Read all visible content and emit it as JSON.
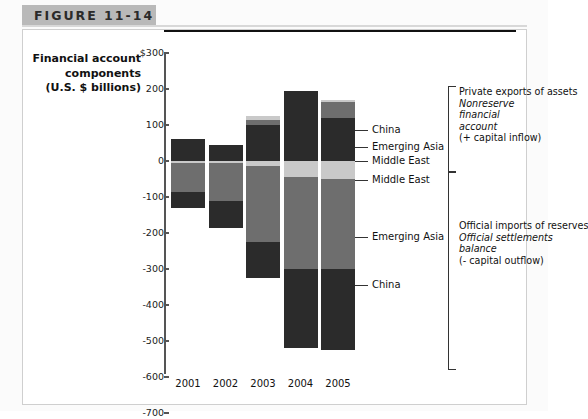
{
  "figure": {
    "label": "FIGURE 11-14"
  },
  "chart_data": {
    "type": "bar",
    "subtype": "stacked-diverging",
    "title": "Financial account components (U.S. $ billions)",
    "title_lines": [
      "Financial account",
      "components",
      "(U.S. $ billions)"
    ],
    "xlabel": "",
    "ylabel": "U.S. $ billions",
    "categories": [
      "2001",
      "2002",
      "2003",
      "2004",
      "2005"
    ],
    "ylim": [
      -700,
      300
    ],
    "ytick_values": [
      300,
      200,
      100,
      0,
      -100,
      -200,
      -300,
      -400,
      -500,
      -600,
      -700
    ],
    "ytick_labels": [
      "$300",
      "200",
      "100",
      "0",
      "-100",
      "-200",
      "-300",
      "-400",
      "-500",
      "-600",
      "-700"
    ],
    "grid": false,
    "legend_position": "right-leader-lines",
    "series": [
      {
        "name": "China",
        "color": "#2b2b2b",
        "group": "private-exports",
        "values": [
          60,
          45,
          100,
          195,
          120
        ]
      },
      {
        "name": "Emerging Asia",
        "color": "#6e6e6e",
        "group": "private-exports",
        "values": [
          0,
          0,
          15,
          0,
          45
        ]
      },
      {
        "name": "Middle East",
        "color": "#c9c9c9",
        "group": "private-exports",
        "values": [
          0,
          0,
          10,
          0,
          5
        ]
      },
      {
        "name": "Middle East",
        "color": "#c9c9c9",
        "group": "official-imports",
        "values": [
          -5,
          -5,
          -15,
          -45,
          -50
        ]
      },
      {
        "name": "Emerging Asia",
        "color": "#6e6e6e",
        "group": "official-imports",
        "values": [
          -80,
          -105,
          -210,
          -255,
          -250
        ]
      },
      {
        "name": "China",
        "color": "#2b2b2b",
        "group": "official-imports",
        "values": [
          -45,
          -75,
          -100,
          -220,
          -225
        ]
      }
    ],
    "annotations": [
      {
        "id": "private-exports",
        "lines": [
          "Private exports of assets",
          "Nonreserve",
          "financial",
          "account",
          "(+ capital inflow)"
        ],
        "italic_lines": [
          1,
          2,
          3
        ]
      },
      {
        "id": "official-imports",
        "lines": [
          "Official imports of reserves",
          "Official settlements",
          "balance",
          "(- capital outflow)"
        ],
        "italic_lines": [
          1,
          2
        ]
      }
    ],
    "leader_labels_upper": [
      "China",
      "Emerging Asia",
      "Middle East"
    ],
    "leader_labels_lower": [
      "Middle East",
      "Emerging Asia",
      "China"
    ]
  }
}
